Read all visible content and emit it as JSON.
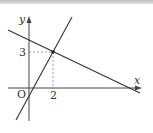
{
  "diagram": {
    "type": "coordinate-plane",
    "axes": {
      "x_label": "x",
      "y_label": "y",
      "origin_label": "O"
    },
    "ticks": {
      "x_tick_label": "2",
      "y_tick_label": "3"
    },
    "intersection_point": {
      "x": 2,
      "y": 3
    },
    "lines": [
      {
        "name": "steep-increasing-line",
        "description": "line with positive slope passing through (2,3)"
      },
      {
        "name": "decreasing-line",
        "description": "line with negative slope passing through (2,3)"
      }
    ],
    "colors": {
      "line": "#333333",
      "guide": "#888888",
      "background": "#ffffff"
    }
  }
}
